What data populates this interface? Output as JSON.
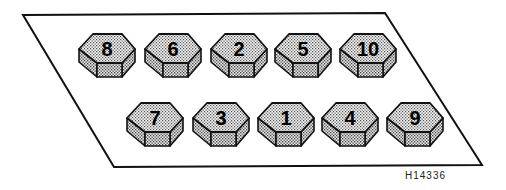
{
  "diagram": {
    "reference_code": "H14336",
    "outline": {
      "points": [
        [
          23,
          15
        ],
        [
          385,
          13
        ],
        [
          482,
          165
        ],
        [
          114,
          167
        ]
      ]
    },
    "row1": [
      {
        "label": "8",
        "x": 79,
        "y": 34
      },
      {
        "label": "6",
        "x": 145,
        "y": 34
      },
      {
        "label": "2",
        "x": 211,
        "y": 34
      },
      {
        "label": "5",
        "x": 275,
        "y": 34
      },
      {
        "label": "10",
        "x": 340,
        "y": 34
      }
    ],
    "row2": [
      {
        "label": "7",
        "x": 127,
        "y": 103
      },
      {
        "label": "3",
        "x": 193,
        "y": 103
      },
      {
        "label": "1",
        "x": 258,
        "y": 103
      },
      {
        "label": "4",
        "x": 322,
        "y": 103
      },
      {
        "label": "9",
        "x": 387,
        "y": 103
      }
    ]
  }
}
